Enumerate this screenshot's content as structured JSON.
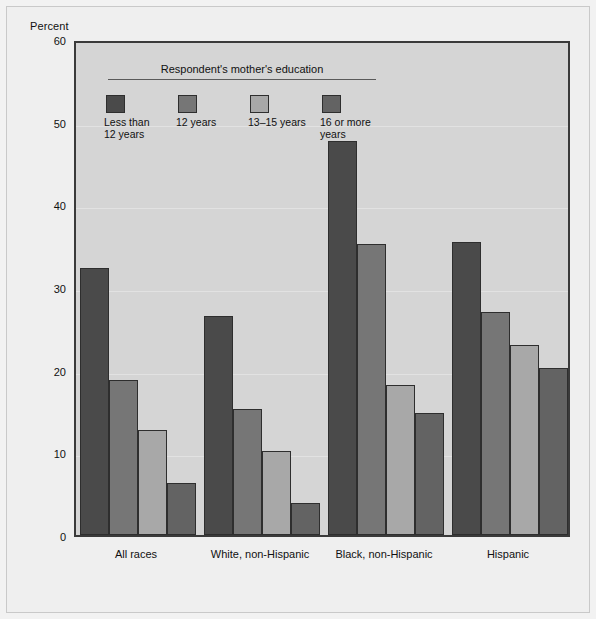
{
  "figure": {
    "y_axis_label": "Percent"
  },
  "legend": {
    "title": "Respondent's mother's education",
    "entries": [
      {
        "label": "Less than 12 years",
        "line1": "Less than",
        "line2": "12 years",
        "color": "#4a4a4a"
      },
      {
        "label": "12 years",
        "line1": "12 years",
        "line2": "",
        "color": "#767676"
      },
      {
        "label": "13–15 years",
        "line1": "13–15 years",
        "line2": "",
        "color": "#a8a8a8"
      },
      {
        "label": "16 or more years",
        "line1": "16 or more",
        "line2": "years",
        "color": "#636363"
      }
    ]
  },
  "chart_data": {
    "type": "bar",
    "title": "",
    "subtitle": "",
    "xlabel": "",
    "ylabel": "Percent",
    "ylim": [
      0,
      60
    ],
    "yticks": [
      0,
      10,
      20,
      30,
      40,
      50,
      60
    ],
    "grid": true,
    "legend_position": "inside-top-left",
    "legend_title": "Respondent's mother's education",
    "categories": [
      "All races",
      "White, non-Hispanic",
      "Black, non-Hispanic",
      "Hispanic"
    ],
    "series": [
      {
        "name": "Less than 12 years",
        "color": "#4a4a4a",
        "values": [
          32.3,
          26.5,
          47.7,
          35.5
        ]
      },
      {
        "name": "12 years",
        "color": "#767676",
        "values": [
          18.7,
          15.3,
          35.2,
          27.0
        ]
      },
      {
        "name": "13–15 years",
        "color": "#a8a8a8",
        "values": [
          12.7,
          10.2,
          18.2,
          23.0
        ]
      },
      {
        "name": "16 or more years",
        "color": "#636363",
        "values": [
          6.3,
          3.9,
          14.7,
          20.2
        ]
      }
    ]
  }
}
